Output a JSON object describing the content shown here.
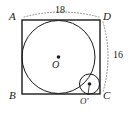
{
  "figure": {
    "type": "geometry-diagram",
    "vertices": {
      "top_left": "A",
      "top_right": "D",
      "bottom_left": "B",
      "bottom_right": "C"
    },
    "measurements": {
      "top_side": "18",
      "right_side": "16"
    },
    "centers": {
      "large_circle": "O",
      "small_circle": "O'"
    },
    "colors": {
      "stroke": "#1a1a1a",
      "dotted": "#8a8a8a",
      "background": "#ffffff"
    }
  }
}
